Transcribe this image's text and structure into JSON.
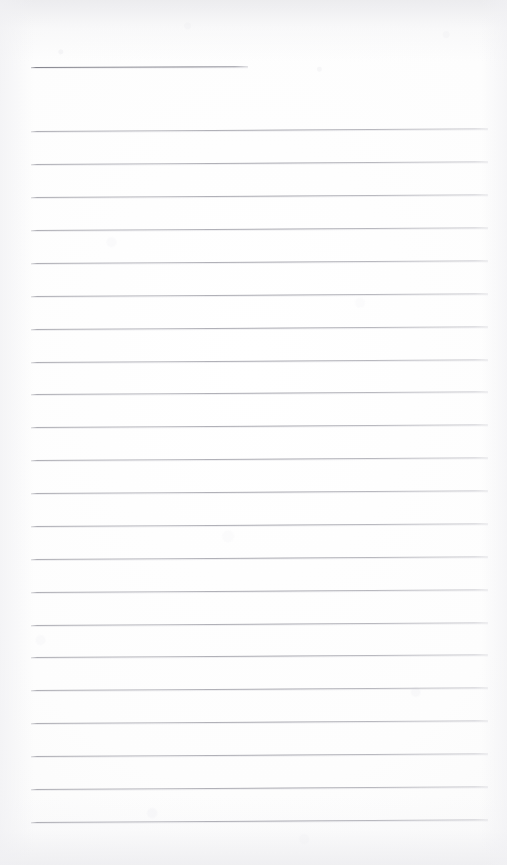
{
  "document": {
    "type": "scanned-lined-notebook-page",
    "title": "",
    "written_text": "",
    "page_width": 507,
    "page_height": 865,
    "colors": {
      "paper": "#fdfdfd",
      "rule_line": "#b0b0b6",
      "header_rule_line": "#86868f",
      "page_edge_shade": "#eceef0"
    },
    "layout": {
      "left_margin_px": 31,
      "right_margin_px": 19,
      "first_rule_y_px": 67,
      "line_spacing_px": 32.7,
      "skew_degrees": -0.35
    }
  },
  "header_rule": {
    "name": "title-rule",
    "x": 31,
    "y": 67,
    "width": 217,
    "label": ""
  },
  "rules": [
    {
      "index": 1,
      "y": 131,
      "x": 31,
      "width": 457,
      "text": ""
    },
    {
      "index": 2,
      "y": 164,
      "x": 31,
      "width": 457,
      "text": ""
    },
    {
      "index": 3,
      "y": 197,
      "x": 31,
      "width": 457,
      "text": ""
    },
    {
      "index": 4,
      "y": 230,
      "x": 31,
      "width": 457,
      "text": ""
    },
    {
      "index": 5,
      "y": 263,
      "x": 31,
      "width": 457,
      "text": ""
    },
    {
      "index": 6,
      "y": 296,
      "x": 31,
      "width": 457,
      "text": ""
    },
    {
      "index": 7,
      "y": 329,
      "x": 31,
      "width": 457,
      "text": ""
    },
    {
      "index": 8,
      "y": 362,
      "x": 31,
      "width": 457,
      "text": ""
    },
    {
      "index": 9,
      "y": 394,
      "x": 31,
      "width": 457,
      "text": ""
    },
    {
      "index": 10,
      "y": 427,
      "x": 31,
      "width": 457,
      "text": ""
    },
    {
      "index": 11,
      "y": 460,
      "x": 31,
      "width": 457,
      "text": ""
    },
    {
      "index": 12,
      "y": 493,
      "x": 31,
      "width": 457,
      "text": ""
    },
    {
      "index": 13,
      "y": 526,
      "x": 31,
      "width": 457,
      "text": ""
    },
    {
      "index": 14,
      "y": 559,
      "x": 31,
      "width": 457,
      "text": ""
    },
    {
      "index": 15,
      "y": 592,
      "x": 31,
      "width": 457,
      "text": ""
    },
    {
      "index": 16,
      "y": 625,
      "x": 31,
      "width": 457,
      "text": ""
    },
    {
      "index": 17,
      "y": 657,
      "x": 31,
      "width": 457,
      "text": ""
    },
    {
      "index": 18,
      "y": 690,
      "x": 31,
      "width": 457,
      "text": ""
    },
    {
      "index": 19,
      "y": 723,
      "x": 31,
      "width": 457,
      "text": ""
    },
    {
      "index": 20,
      "y": 756,
      "x": 31,
      "width": 457,
      "text": ""
    },
    {
      "index": 21,
      "y": 789,
      "x": 31,
      "width": 457,
      "text": ""
    },
    {
      "index": 22,
      "y": 822,
      "x": 31,
      "width": 457,
      "text": ""
    }
  ]
}
